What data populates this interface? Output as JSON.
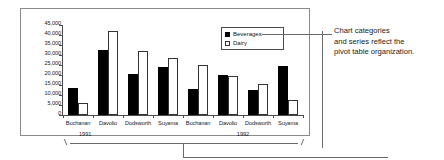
{
  "annotation": {
    "line1": "Chart categories",
    "line2": "and series reflect the",
    "line3": "pivot table organization."
  },
  "legend": {
    "items": [
      {
        "label": "Beverages",
        "color": "#000000",
        "marker": "filled-square"
      },
      {
        "label": "Dairy",
        "color": "#ffffff",
        "marker": "hollow-square"
      }
    ]
  },
  "chart_data": {
    "type": "bar",
    "title": "",
    "xlabel": "",
    "ylabel": "",
    "ylim": [
      0,
      45000
    ],
    "grid": false,
    "legend_position": "top-right",
    "yticks": [
      0,
      5000,
      10000,
      15000,
      20000,
      25000,
      30000,
      35000,
      40000,
      45000
    ],
    "ytick_labels": [
      "0",
      "5,000",
      "10,000",
      "15,000",
      "20,000",
      "25,000",
      "30,000",
      "35,000",
      "40,000",
      "45,000"
    ],
    "categories": [
      "Buchanan",
      "Davolio",
      "Dodsworth",
      "Suyama",
      "Buchanan",
      "Davolio",
      "Dodsworth",
      "Suyama"
    ],
    "groups": [
      {
        "label": "1991",
        "categories": [
          "Buchanan",
          "Davolio",
          "Dodsworth",
          "Suyama"
        ]
      },
      {
        "label": "1992",
        "categories": [
          "Buchanan",
          "Davolio",
          "Dodsworth",
          "Suyama"
        ]
      }
    ],
    "series": [
      {
        "name": "Beverages",
        "values": [
          13500,
          32500,
          20500,
          24000,
          13000,
          19800,
          12500,
          24500
        ]
      },
      {
        "name": "Dairy",
        "values": [
          6000,
          42000,
          32000,
          28500,
          25000,
          19300,
          15500,
          7500
        ]
      }
    ]
  }
}
